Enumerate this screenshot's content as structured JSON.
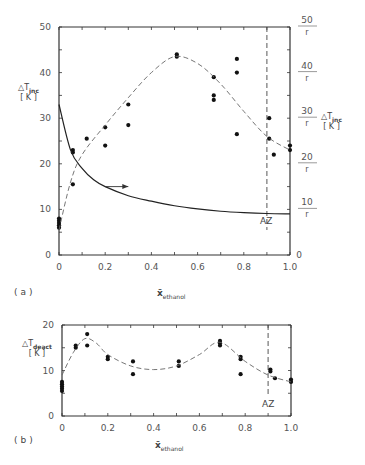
{
  "figure": {
    "panel_a_label": "(a)",
    "panel_b_label": "(b)",
    "az_label": "AZ",
    "arrow_hint": "right-axis"
  },
  "chart_data": [
    {
      "type": "scatter",
      "panel": "a",
      "xlabel": "x̄ ethanol",
      "ylabel": "ΔT inc [K]",
      "ylabel_right": "ΔT inc [K]",
      "xlim": [
        0,
        1.0
      ],
      "ylim": [
        0,
        50
      ],
      "x_ticks": [
        "0",
        "0.2",
        "0.4",
        "0.6",
        "0.8",
        "1.0"
      ],
      "y_ticks": [
        "0",
        "10",
        "20",
        "30",
        "40",
        "50"
      ],
      "y_ticks_right": [
        "0",
        "10/r",
        "20/r",
        "30/r",
        "40/r",
        "50/r"
      ],
      "azeotrope_x": 0.9,
      "series": [
        {
          "name": "measured ΔT_inc",
          "style": "points",
          "points": [
            [
              0.0,
              6
            ],
            [
              0.0,
              6.5
            ],
            [
              0.0,
              7
            ],
            [
              0.0,
              7.5
            ],
            [
              0.0,
              8
            ],
            [
              0.06,
              23
            ],
            [
              0.06,
              22.5
            ],
            [
              0.06,
              15.5
            ],
            [
              0.12,
              25.5
            ],
            [
              0.2,
              28
            ],
            [
              0.2,
              24
            ],
            [
              0.3,
              33
            ],
            [
              0.3,
              28.5
            ],
            [
              0.51,
              44
            ],
            [
              0.51,
              43.5
            ],
            [
              0.67,
              39
            ],
            [
              0.67,
              35
            ],
            [
              0.67,
              34
            ],
            [
              0.77,
              43
            ],
            [
              0.77,
              40
            ],
            [
              0.77,
              26.5
            ],
            [
              0.91,
              30
            ],
            [
              0.91,
              25.5
            ],
            [
              0.93,
              22
            ],
            [
              1.0,
              24
            ],
            [
              1.0,
              23
            ]
          ]
        },
        {
          "name": "fit (dashed)",
          "style": "dashed",
          "points": [
            [
              0.0,
              5.5
            ],
            [
              0.05,
              16
            ],
            [
              0.1,
              22
            ],
            [
              0.2,
              28.5
            ],
            [
              0.3,
              34.5
            ],
            [
              0.4,
              40
            ],
            [
              0.5,
              43.5
            ],
            [
              0.6,
              42
            ],
            [
              0.7,
              37.5
            ],
            [
              0.8,
              31.5
            ],
            [
              0.9,
              26
            ],
            [
              1.0,
              23
            ]
          ]
        },
        {
          "name": "r curve (solid, right axis)",
          "style": "solid",
          "points": [
            [
              0.0,
              33
            ],
            [
              0.05,
              23
            ],
            [
              0.1,
              19
            ],
            [
              0.15,
              16.5
            ],
            [
              0.2,
              15
            ],
            [
              0.3,
              13
            ],
            [
              0.4,
              11.8
            ],
            [
              0.5,
              10.8
            ],
            [
              0.6,
              10.1
            ],
            [
              0.7,
              9.6
            ],
            [
              0.8,
              9.3
            ],
            [
              0.9,
              9.1
            ],
            [
              1.0,
              9
            ]
          ]
        }
      ]
    },
    {
      "type": "scatter",
      "panel": "b",
      "xlabel": "x̄ ethanol",
      "ylabel": "ΔT deact [K]",
      "xlim": [
        0,
        1.0
      ],
      "ylim": [
        0,
        20
      ],
      "x_ticks": [
        "0",
        "0.2",
        "0.4",
        "0.6",
        "0.8",
        "1.0"
      ],
      "y_ticks": [
        "0",
        "10",
        "20"
      ],
      "azeotrope_x": 0.9,
      "series": [
        {
          "name": "measured ΔT_deact",
          "style": "points",
          "points": [
            [
              0.0,
              5.5
            ],
            [
              0.0,
              6
            ],
            [
              0.0,
              6.5
            ],
            [
              0.0,
              7
            ],
            [
              0.0,
              7.5
            ],
            [
              0.06,
              15
            ],
            [
              0.06,
              15.5
            ],
            [
              0.11,
              18
            ],
            [
              0.11,
              15.5
            ],
            [
              0.2,
              13
            ],
            [
              0.2,
              12.5
            ],
            [
              0.31,
              12
            ],
            [
              0.31,
              9.2
            ],
            [
              0.51,
              12
            ],
            [
              0.51,
              11
            ],
            [
              0.69,
              16.5
            ],
            [
              0.69,
              16
            ],
            [
              0.69,
              15.5
            ],
            [
              0.78,
              13
            ],
            [
              0.78,
              12.5
            ],
            [
              0.78,
              9.2
            ],
            [
              0.91,
              10.2
            ],
            [
              0.91,
              9.8
            ],
            [
              0.93,
              8.3
            ],
            [
              1.0,
              8
            ],
            [
              1.0,
              7.5
            ]
          ]
        },
        {
          "name": "fit (dashed)",
          "style": "dashed",
          "points": [
            [
              0.0,
              9
            ],
            [
              0.05,
              14
            ],
            [
              0.1,
              17
            ],
            [
              0.15,
              16
            ],
            [
              0.2,
              13.5
            ],
            [
              0.3,
              11
            ],
            [
              0.4,
              10.2
            ],
            [
              0.5,
              11
            ],
            [
              0.6,
              13.5
            ],
            [
              0.69,
              16.2
            ],
            [
              0.8,
              12
            ],
            [
              0.9,
              9
            ],
            [
              1.0,
              7.5
            ]
          ]
        }
      ]
    }
  ]
}
